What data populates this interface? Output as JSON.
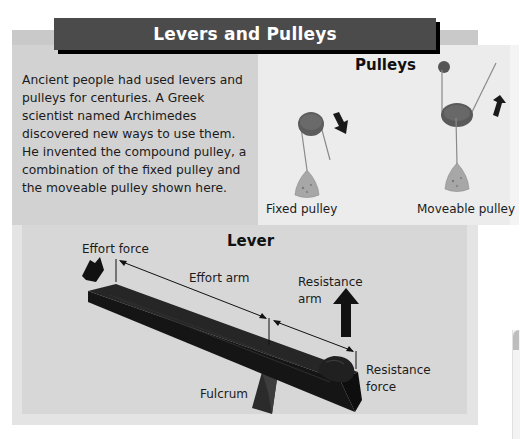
{
  "header": {
    "title": "Levers and Pulleys",
    "bar_color": "#4b4b4b",
    "title_color": "#ffffff"
  },
  "intro": {
    "text": "Ancient people had used levers and pulleys for centuries. A Greek scientist named Archimedes discovered new ways to use them. He invented the compound pulley, a combination of the fixed pulley and the moveable pulley shown here."
  },
  "pulleys": {
    "title": "Pulleys",
    "items": [
      {
        "label": "Fixed pulley",
        "arrow": "down-arrow"
      },
      {
        "label": "Moveable pulley",
        "arrow": "up-arrow"
      }
    ]
  },
  "lever": {
    "title": "Lever",
    "labels": {
      "effort_force": "Effort force",
      "effort_arm": "Effort arm",
      "resistance_arm_line1": "Resistance",
      "resistance_arm_line2": "arm",
      "resistance_force_line1": "Resistance",
      "resistance_force_line2": "force",
      "fulcrum": "Fulcrum"
    }
  }
}
